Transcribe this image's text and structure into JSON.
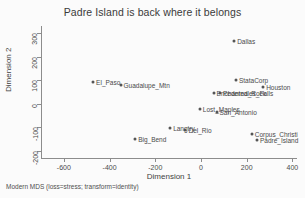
{
  "chart_data": {
    "type": "scatter",
    "title": "Padre Island is back where it belongs",
    "xlabel": "Dimension 1",
    "ylabel": "Dimension 2",
    "xlim": [
      -700,
      420
    ],
    "ylim": [
      -230,
      330
    ],
    "xticks": [
      -600,
      -400,
      -200,
      0,
      200,
      400
    ],
    "xticklabels": [
      "-600",
      "-400",
      "-200",
      "0",
      "200",
      "400"
    ],
    "yticks": [
      -200,
      -100,
      0,
      100,
      200,
      300
    ],
    "yticklabels": [
      "-200",
      "-100",
      "0",
      "100",
      "200",
      "300"
    ],
    "grid": false,
    "legend": null,
    "note": "Modern MDS (loss=stress; transform=identity)",
    "marker_color": "#555555",
    "axis_color": "#8c8c8c",
    "points": [
      {
        "label": "Dallas",
        "x": 145,
        "y": 265,
        "anchor": "right"
      },
      {
        "label": "StataCorp",
        "x": 153,
        "y": 103,
        "anchor": "right"
      },
      {
        "label": "Houston",
        "x": 272,
        "y": 70,
        "anchor": "right"
      },
      {
        "label": "Pedernales_Falls",
        "x": 83,
        "y": 45,
        "anchor": "right"
      },
      {
        "label": "Enchanted_Rock",
        "x": 55,
        "y": 45,
        "anchor": "right"
      },
      {
        "label": "Lost_Maples",
        "x": -5,
        "y": -22,
        "anchor": "right"
      },
      {
        "label": "San_Antonio",
        "x": 68,
        "y": -35,
        "anchor": "right"
      },
      {
        "label": "El_Paso",
        "x": -472,
        "y": 92,
        "anchor": "right"
      },
      {
        "label": "Guadalupe_Mtn",
        "x": -352,
        "y": 80,
        "anchor": "right"
      },
      {
        "label": "Langtry",
        "x": -135,
        "y": -103,
        "anchor": "right"
      },
      {
        "label": "Del_Rio",
        "x": -68,
        "y": -110,
        "anchor": "right"
      },
      {
        "label": "Big_Bend",
        "x": -288,
        "y": -150,
        "anchor": "right"
      },
      {
        "label": "Corpus_Christi",
        "x": 222,
        "y": -128,
        "anchor": "right"
      },
      {
        "label": "Padre_Island",
        "x": 245,
        "y": -155,
        "anchor": "right"
      }
    ]
  }
}
